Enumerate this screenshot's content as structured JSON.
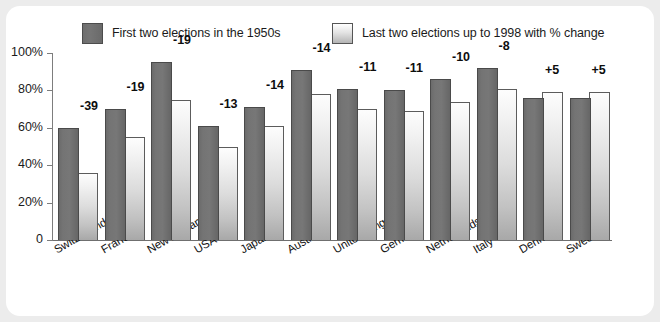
{
  "chart_data": {
    "type": "bar",
    "title": "",
    "xlabel": "",
    "ylabel": "",
    "ylim": [
      0,
      100
    ],
    "yticks": [
      "0",
      "20%",
      "40%",
      "60%",
      "80%",
      "100%"
    ],
    "ytick_values": [
      0,
      20,
      40,
      60,
      80,
      100
    ],
    "grid": false,
    "legend_position": "top",
    "categories": [
      "Switzerland",
      "France",
      "New Zealand",
      "USA",
      "Japan",
      "Austria",
      "United Kingdom",
      "Germany",
      "Netherlands",
      "Italy",
      "Denmark",
      "Sweden"
    ],
    "series": [
      {
        "name": "First two elections in the 1950s",
        "color": "#6f6f6f",
        "values": [
          60,
          70,
          95,
          61,
          71,
          91,
          81,
          80,
          86,
          92,
          76,
          76
        ]
      },
      {
        "name": "Last two elections up to 1998 with % change",
        "color": "#dcdcdc",
        "values": [
          36,
          55,
          75,
          50,
          61,
          78,
          70,
          69,
          74,
          81,
          79,
          79
        ]
      }
    ],
    "annotations": [
      "-39",
      "-19",
      "-19",
      "-13",
      "-14",
      "-14",
      "-11",
      "-11",
      "-10",
      "-8",
      "+5",
      "+5"
    ]
  },
  "legend": {
    "items": [
      {
        "label": "First two elections in the 1950s",
        "swatch": "dark-gray-swatch"
      },
      {
        "label": "Last two elections up to 1998 with % change",
        "swatch": "light-gray-swatch"
      }
    ]
  },
  "colors": {
    "page_background": "#ececec",
    "panel_background": "#ffffff",
    "series1": "#6f6f6f",
    "series2": "#dcdcdc",
    "axis": "#7d7d7d",
    "text": "#1b1b1b"
  }
}
